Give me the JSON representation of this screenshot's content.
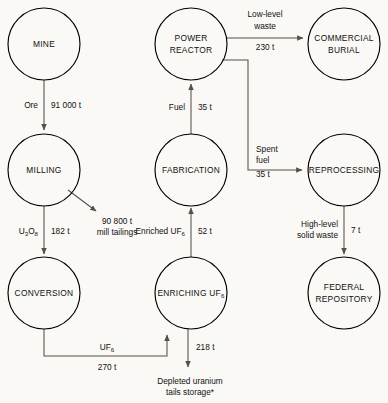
{
  "diagram": {
    "background_color": "#faf9f5",
    "line_color": "#55504c",
    "node_stroke_color": "#000000",
    "text_color": "#111111"
  },
  "nodes": {
    "mine": {
      "label": "MINE",
      "cx": 44,
      "cy": 44,
      "r": 36
    },
    "power_reactor": {
      "label_line1": "POWER",
      "label_line2": "REACTOR",
      "cx": 191,
      "cy": 44,
      "r": 36
    },
    "commercial_burial": {
      "label_line1": "COMMERCIAL",
      "label_line2": "BURIAL",
      "cx": 344,
      "cy": 44,
      "r": 36
    },
    "milling": {
      "label": "MILLING",
      "cx": 44,
      "cy": 170,
      "r": 36
    },
    "fabrication": {
      "label": "FABRICATION",
      "cx": 191,
      "cy": 170,
      "r": 36
    },
    "reprocessing": {
      "label": "REPROCESSING",
      "cx": 344,
      "cy": 170,
      "r": 36
    },
    "conversion": {
      "label": "CONVERSION",
      "cx": 44,
      "cy": 293,
      "r": 36
    },
    "enriching": {
      "label_main": "ENRICHING UF",
      "label_sub": "6",
      "cx": 191,
      "cy": 293,
      "r": 36
    },
    "federal_repository": {
      "label_line1": "FEDERAL",
      "label_line2": "REPOSITORY",
      "cx": 344,
      "cy": 293,
      "r": 36
    }
  },
  "edges": {
    "mine_to_milling": {
      "name": "Ore",
      "amount": "91 000 t"
    },
    "milling_tailings": {
      "amount": "90 800 t",
      "name": "mill tailings"
    },
    "milling_to_conversion": {
      "name_main": "U",
      "name_sub1": "3",
      "name_mid": "O",
      "name_sub2": "8",
      "amount": "182 t"
    },
    "conversion_to_enriching": {
      "name_main": "UF",
      "name_sub": "6",
      "amount": "270 t"
    },
    "enriching_tails": {
      "amount": "218 t",
      "label_line1": "Depleted uranium",
      "label_line2": "tails storage*"
    },
    "enriching_to_fabrication": {
      "name_main": "Enriched UF",
      "name_sub": "6",
      "amount": "52 t"
    },
    "fabrication_to_reactor": {
      "name": "Fuel",
      "amount": "35 t"
    },
    "reactor_to_burial": {
      "label_line1": "Low-level",
      "label_line2": "waste",
      "amount": "230 t"
    },
    "reactor_to_reprocessing": {
      "label_line1": "Spent",
      "label_line2": "fuel",
      "amount": "35 t"
    },
    "reprocessing_to_repository": {
      "label_line1": "High-level",
      "label_line2": "solid waste",
      "amount": "7 t"
    }
  }
}
